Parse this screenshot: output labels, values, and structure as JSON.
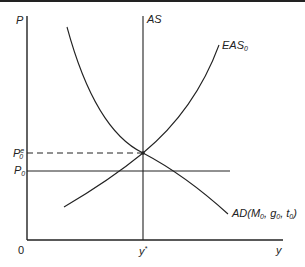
{
  "diagram": {
    "type": "economics AS-AD diagram",
    "axes": {
      "y_label": "P",
      "x_label": "y",
      "origin_label": "0"
    },
    "curves": {
      "as": "AS",
      "eas": "EAS",
      "eas_sub": "0",
      "ad": "AD(M",
      "ad_m_sub": "0",
      "ad_g": ", g",
      "ad_g_sub": "0",
      "ad_t": ", t",
      "ad_t_sub": "0",
      "ad_close": ")"
    },
    "price_levels": {
      "expected_base": "P",
      "expected_sup": "e",
      "expected_sub": "0",
      "actual_base": "P",
      "actual_sub": "0"
    },
    "output_level": {
      "base": "y",
      "sup": "*"
    },
    "colors": {
      "ink": "#222222",
      "background": "#ffffff"
    }
  }
}
